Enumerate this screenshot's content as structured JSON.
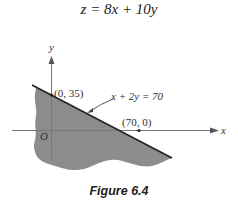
{
  "objective": {
    "text": "z = 8x + 10y"
  },
  "axes": {
    "x_label": "x",
    "y_label": "y",
    "origin_label": "O"
  },
  "constraint_line": {
    "equation": "x + 2y = 70",
    "intercepts": [
      {
        "label": "(0, 35)",
        "x": 0,
        "y": 35
      },
      {
        "label": "(70, 0)",
        "x": 70,
        "y": 0
      }
    ]
  },
  "region": {
    "description": "shaded feasible half-plane below line x + 2y = 70",
    "fill_color": "#8c8c8c"
  },
  "colors": {
    "line": "#222222",
    "axes": "#777777",
    "shade": "#8c8c8c"
  },
  "caption": {
    "text": "Figure 6.4"
  }
}
